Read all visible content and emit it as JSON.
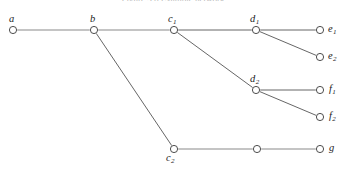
{
  "figure": {
    "type": "node-link-tree-diagram",
    "width": 346,
    "height": 171,
    "background_color": "#ffffff",
    "top_caption_clipped": "Figure 3.6  Example network",
    "colors": {
      "node_stroke": "#3a3a3a",
      "node_fill": "#ffffff",
      "edge_light": "#b0b0b0",
      "edge_dark": "#555555",
      "label_text": "#1c1c1c"
    },
    "nodes": [
      {
        "id": "a",
        "label": "a",
        "sub": "",
        "x": 13,
        "y": 30,
        "label_x": 9,
        "label_y": 14,
        "r": 3.6,
        "show_label": true
      },
      {
        "id": "b",
        "label": "b",
        "sub": "",
        "x": 94,
        "y": 30,
        "label_x": 90,
        "label_y": 14,
        "r": 3.6,
        "show_label": true
      },
      {
        "id": "c1",
        "label": "c",
        "sub": "1",
        "x": 174,
        "y": 30,
        "label_x": 168,
        "label_y": 14,
        "r": 3.6,
        "show_label": true
      },
      {
        "id": "d1",
        "label": "d",
        "sub": "1",
        "x": 256,
        "y": 30,
        "label_x": 250,
        "label_y": 14,
        "r": 3.6,
        "show_label": true
      },
      {
        "id": "e1",
        "label": "e",
        "sub": "1",
        "x": 320,
        "y": 30,
        "label_x": 328,
        "label_y": 24,
        "r": 3.6,
        "show_label": true
      },
      {
        "id": "e2",
        "label": "e",
        "sub": "2",
        "x": 320,
        "y": 57,
        "label_x": 328,
        "label_y": 51,
        "r": 3.6,
        "show_label": true
      },
      {
        "id": "d2",
        "label": "d",
        "sub": "2",
        "x": 256,
        "y": 90,
        "label_x": 250,
        "label_y": 74,
        "r": 3.6,
        "show_label": true
      },
      {
        "id": "f1",
        "label": "f",
        "sub": "1",
        "x": 320,
        "y": 90,
        "label_x": 329,
        "label_y": 84,
        "r": 3.6,
        "show_label": true
      },
      {
        "id": "f2",
        "label": "f",
        "sub": "2",
        "x": 320,
        "y": 117,
        "label_x": 329,
        "label_y": 111,
        "r": 3.6,
        "show_label": true
      },
      {
        "id": "c2",
        "label": "c",
        "sub": "2",
        "x": 174,
        "y": 149,
        "label_x": 166,
        "label_y": 153,
        "r": 3.6,
        "show_label": true
      },
      {
        "id": "m",
        "label": "",
        "sub": "",
        "x": 257,
        "y": 149,
        "label_x": 0,
        "label_y": 0,
        "r": 3.6,
        "show_label": false
      },
      {
        "id": "g",
        "label": "g",
        "sub": "",
        "x": 320,
        "y": 149,
        "label_x": 329,
        "label_y": 143,
        "r": 3.6,
        "show_label": true
      }
    ],
    "edges": [
      {
        "from": "a",
        "to": "b",
        "style": "light"
      },
      {
        "from": "b",
        "to": "c1",
        "style": "light"
      },
      {
        "from": "c1",
        "to": "d1",
        "style": "dark"
      },
      {
        "from": "d1",
        "to": "e1",
        "style": "dark"
      },
      {
        "from": "d1",
        "to": "e2",
        "style": "dark"
      },
      {
        "from": "c1",
        "to": "d2",
        "style": "dark"
      },
      {
        "from": "d2",
        "to": "f1",
        "style": "dark"
      },
      {
        "from": "d2",
        "to": "f2",
        "style": "dark"
      },
      {
        "from": "b",
        "to": "c2",
        "style": "dark"
      },
      {
        "from": "c2",
        "to": "m",
        "style": "light"
      },
      {
        "from": "m",
        "to": "g",
        "style": "light"
      }
    ]
  }
}
